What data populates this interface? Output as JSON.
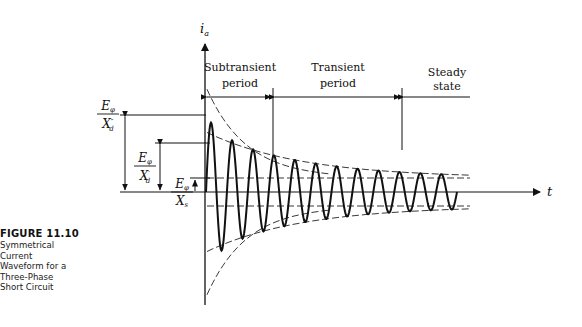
{
  "figure": {
    "number_label": "FIGURE 11.10",
    "caption_lines": [
      "Symmetrical",
      "Current",
      "Waveform for a",
      "Three-Phase",
      "Short Circuit"
    ]
  },
  "axes": {
    "y_label": "i",
    "y_label_sub": "a",
    "x_label": "t"
  },
  "periods": [
    {
      "line1": "Subtransient",
      "line2": "period"
    },
    {
      "line1": "Transient",
      "line2": "period"
    },
    {
      "line1": "Steady",
      "line2": "state"
    }
  ],
  "levels": [
    {
      "name": "subtransient",
      "numerator": "E",
      "num_sub": "φ",
      "denominator": "X",
      "den_sub": "d",
      "den_sup": "″",
      "relative_amplitude": 1.0
    },
    {
      "name": "transient",
      "numerator": "E",
      "num_sub": "φ",
      "denominator": "X",
      "den_sub": "d",
      "den_sup": "′",
      "relative_amplitude": 0.62
    },
    {
      "name": "steady",
      "numerator": "E",
      "num_sub": "φ",
      "denominator": "X",
      "den_sub": "s",
      "den_sup": "",
      "relative_amplitude": 0.18
    }
  ],
  "waveform": {
    "cycles": 12,
    "description": "Symmetrical decaying sinusoidal short-circuit current with subtransient and transient envelopes (dashed)"
  }
}
